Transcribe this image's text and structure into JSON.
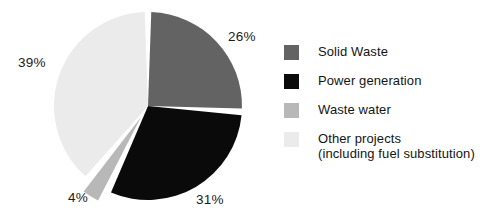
{
  "chart_data": {
    "type": "pie",
    "title": "",
    "subtitle": "",
    "xlabel": "",
    "ylabel": "",
    "legend_position": "right",
    "grid": false,
    "start_angle_deg": 0,
    "direction": "clockwise",
    "categories": [
      "Solid Waste",
      "Power generation",
      "Waste water",
      "Other projects (including fuel substitution)"
    ],
    "values": [
      26,
      31,
      4,
      39
    ],
    "value_unit": "%",
    "data_labels": [
      "26%",
      "31%",
      "4%",
      "39%"
    ],
    "slice_colors": [
      "#636363",
      "#0a0a0a",
      "#b8b8b8",
      "#ebebeb"
    ],
    "exploded_slices": [
      "Waste water"
    ],
    "slices": [
      {
        "label": "Solid Waste",
        "value": 26,
        "data_label": "26%",
        "color": "#636363",
        "exploded": false
      },
      {
        "label": "Power generation",
        "value": 31,
        "data_label": "31%",
        "color": "#0a0a0a",
        "exploded": false
      },
      {
        "label": "Waste water",
        "value": 4,
        "data_label": "4%",
        "color": "#b8b8b8",
        "exploded": true
      },
      {
        "label": "Other projects (including fuel substitution)",
        "value": 39,
        "data_label": "39%",
        "color": "#ebebeb",
        "exploded": false
      }
    ]
  },
  "labels": {
    "pct_solid_waste": "26%",
    "pct_power_generation": "31%",
    "pct_waste_water": "4%",
    "pct_other_projects": "39%"
  },
  "legend": {
    "items": [
      {
        "label": "Solid Waste",
        "color": "#636363"
      },
      {
        "label": "Power generation",
        "color": "#0a0a0a"
      },
      {
        "label": "Waste water",
        "color": "#b8b8b8"
      },
      {
        "label": "Other projects\n(including fuel substitution)",
        "color": "#ebebeb"
      }
    ]
  },
  "colors": {
    "background": "#ffffff",
    "separator": "#ffffff",
    "text": "#141414"
  }
}
